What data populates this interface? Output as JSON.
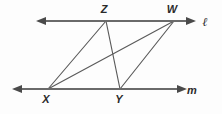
{
  "figure": {
    "background_color": "#fdfdfd",
    "stroke_color": "#5a5a5a",
    "label_color": "#2b2b2b",
    "width": 222,
    "height": 114
  },
  "points": {
    "Z": {
      "label": "Z",
      "x": 106,
      "y": 21,
      "label_x": 104,
      "label_y": 13
    },
    "W": {
      "label": "W",
      "x": 174,
      "y": 21,
      "label_x": 170,
      "label_y": 13
    },
    "X": {
      "label": "X",
      "x": 48,
      "y": 89,
      "label_x": 45,
      "label_y": 101
    },
    "Y": {
      "label": "Y",
      "x": 120,
      "y": 89,
      "label_x": 117,
      "label_y": 101
    }
  },
  "lines": [
    {
      "name": "line-l",
      "label": "ℓ",
      "label_x": 203,
      "label_y": 25,
      "x1": 40,
      "y1": 21,
      "x2": 190,
      "y2": 21,
      "arrow_left": true,
      "arrow_right": true,
      "description": "upper horizontal line through Z and W"
    },
    {
      "name": "line-m",
      "label": "m",
      "label_x": 187,
      "label_y": 94,
      "x1": 16,
      "y1": 89,
      "x2": 181,
      "y2": 89,
      "arrow_left": true,
      "arrow_right": true,
      "description": "lower horizontal line through X and Y"
    }
  ],
  "segments": [
    {
      "name": "segment-XZ",
      "from": "X",
      "to": "Z"
    },
    {
      "name": "segment-XW",
      "from": "X",
      "to": "W"
    },
    {
      "name": "segment-YZ",
      "from": "Y",
      "to": "Z"
    },
    {
      "name": "segment-YW",
      "from": "Y",
      "to": "W"
    }
  ],
  "labels": {
    "Z": "Z",
    "W": "W",
    "X": "X",
    "Y": "Y",
    "l": "ℓ",
    "m": "m"
  }
}
